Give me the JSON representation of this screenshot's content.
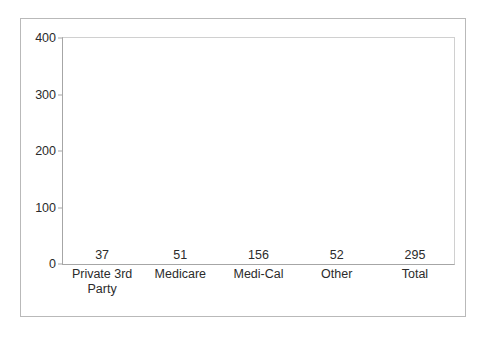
{
  "chart_data": {
    "type": "bar",
    "title": "",
    "subtitle": "",
    "xlabel": "",
    "ylabel": "",
    "categories": [
      "Private 3rd Party",
      "Medicare",
      "Medi-Cal",
      "Other",
      "Total"
    ],
    "values": [
      37,
      51,
      156,
      52,
      295
    ],
    "data_labels": [
      "37",
      "51",
      "156",
      "52",
      "295"
    ],
    "series": [
      {
        "name": "Count",
        "values": [
          37,
          51,
          156,
          52,
          295
        ]
      }
    ],
    "ylim": [
      0,
      400
    ],
    "y_ticks": [
      0,
      100,
      200,
      300,
      400
    ],
    "y_tick_labels": [
      "0",
      "100",
      "200",
      "300",
      "400"
    ],
    "grid": false,
    "legend": false,
    "legend_position": "none",
    "bar_color": "#999999",
    "text_color": "#2b2b2b",
    "axis_color": "#a6a6a6",
    "frame_color": "#b9b9b9",
    "background": "#ffffff"
  }
}
